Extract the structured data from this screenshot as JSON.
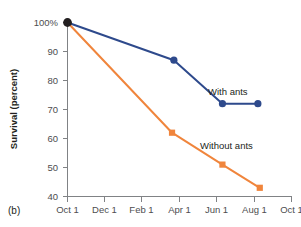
{
  "panel": {
    "label": "(b)"
  },
  "chart_data": {
    "type": "line",
    "title": "",
    "xlabel": "",
    "ylabel": "Survival (percent)",
    "grid": false,
    "legend_position": "inline-right",
    "x_tick_labels": [
      "Oct 1",
      "Dec 1",
      "Feb 1",
      "Apr 1",
      "Jun 1",
      "Aug 1",
      "Oct 1"
    ],
    "x_tick_values": [
      0,
      1,
      2,
      3,
      4,
      5,
      6
    ],
    "xlim": [
      0,
      6
    ],
    "y_tick_labels": [
      "100%",
      "90",
      "80",
      "70",
      "60",
      "50",
      "40"
    ],
    "y_tick_values": [
      100,
      90,
      80,
      70,
      60,
      50,
      40
    ],
    "ylim": [
      40,
      100
    ],
    "series": [
      {
        "name": "With ants",
        "color": "#2e4a8c",
        "marker": "circle",
        "label_text": "With ants",
        "points": [
          {
            "x": 0.0,
            "y": 100
          },
          {
            "x": 2.85,
            "y": 87
          },
          {
            "x": 4.15,
            "y": 72
          },
          {
            "x": 5.1,
            "y": 72
          }
        ]
      },
      {
        "name": "Without ants",
        "color": "#f0853c",
        "marker": "square",
        "label_text": "Without ants",
        "points": [
          {
            "x": 0.0,
            "y": 100
          },
          {
            "x": 2.8,
            "y": 62
          },
          {
            "x": 4.15,
            "y": 51
          },
          {
            "x": 5.15,
            "y": 43
          }
        ]
      }
    ],
    "origin_marker": {
      "color": "#231f20",
      "shape": "circle",
      "x": 0.0,
      "y": 100
    }
  }
}
